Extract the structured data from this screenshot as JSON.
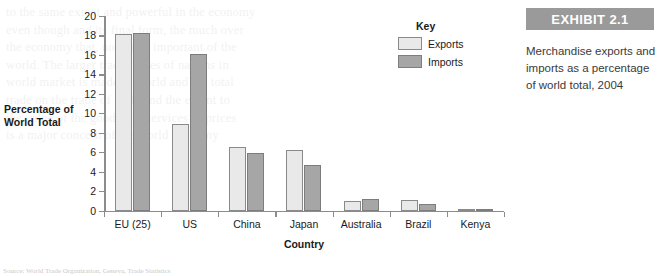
{
  "exhibit": {
    "badge": "EXHIBIT 2.1",
    "caption": "Merchandise exports and imports as a percentage of world total, 2004"
  },
  "legend": {
    "title": "Key",
    "entries": [
      {
        "label": "Exports",
        "color": "#e9e9e9"
      },
      {
        "label": "Imports",
        "color": "#a6a6a6"
      }
    ]
  },
  "source_note": "Source: World Trade Organization, Geneva, Trade Statistics",
  "chart_data": {
    "type": "bar",
    "title": "",
    "xlabel": "Country",
    "ylabel": "Percentage of World Total",
    "categories": [
      "EU (25)",
      "US",
      "China",
      "Japan",
      "Australia",
      "Brazil",
      "Kenya"
    ],
    "series": [
      {
        "name": "Exports",
        "color": "#e9e9e9",
        "values": [
          18.1,
          8.9,
          6.5,
          6.2,
          1.0,
          1.1,
          0.05
        ]
      },
      {
        "name": "Imports",
        "color": "#a6a6a6",
        "values": [
          18.3,
          16.1,
          5.9,
          4.7,
          1.2,
          0.7,
          0.05
        ]
      }
    ],
    "ylim": [
      0,
      20
    ],
    "yticks": [
      0,
      2,
      4,
      6,
      8,
      10,
      12,
      14,
      16,
      18,
      20
    ],
    "grid": false,
    "legend_position": "top-right"
  },
  "ghost_text": [
    "to the same extent and powerful in the economy",
    "even though and its final form, the much over",
    "the economy that, non most important of the",
    "world. The larger trade routes of nations in",
    "world market is made of world and the total",
    "trade on the trade of trade and the extent to",
    "the value of the goods and services of prices",
    "is a major concern of the world economy"
  ]
}
